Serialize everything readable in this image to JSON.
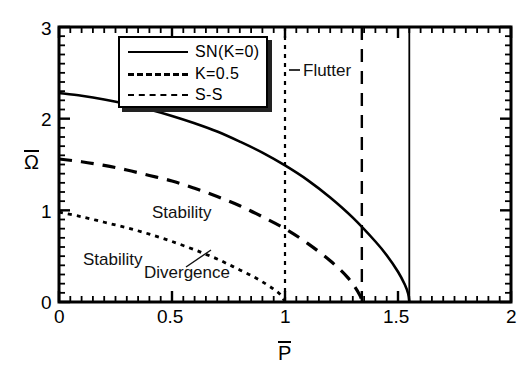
{
  "chart_data": {
    "type": "line",
    "title": "",
    "xlabel": "P̄",
    "ylabel": "Ω̄",
    "xlim": [
      0,
      2
    ],
    "ylim": [
      0,
      3
    ],
    "xticks": [
      "0",
      "0.5",
      "1",
      "1.5",
      "2"
    ],
    "xtick_values": [
      0,
      0.5,
      1,
      1.5,
      2
    ],
    "yticks": [
      "0",
      "1",
      "2",
      "3"
    ],
    "ytick_values": [
      0,
      1,
      2,
      3
    ],
    "grid": false,
    "legend_position": "top-left",
    "series": [
      {
        "name": "SN(K=0)",
        "style": "solid",
        "x": [
          0.0,
          0.1,
          0.2,
          0.3,
          0.4,
          0.5,
          0.6,
          0.7,
          0.8,
          0.9,
          1.0,
          1.1,
          1.2,
          1.3,
          1.4,
          1.45,
          1.5,
          1.53,
          1.545,
          1.55
        ],
        "y": [
          2.28,
          2.25,
          2.21,
          2.16,
          2.1,
          2.03,
          1.95,
          1.86,
          1.75,
          1.63,
          1.49,
          1.33,
          1.14,
          0.92,
          0.66,
          0.51,
          0.33,
          0.19,
          0.09,
          0.0
        ]
      },
      {
        "name": "K=0.5",
        "style": "dashed",
        "x": [
          0.0,
          0.1,
          0.2,
          0.3,
          0.4,
          0.5,
          0.6,
          0.7,
          0.8,
          0.9,
          1.0,
          1.1,
          1.2,
          1.28,
          1.33,
          1.34
        ],
        "y": [
          1.56,
          1.53,
          1.49,
          1.44,
          1.38,
          1.32,
          1.24,
          1.15,
          1.05,
          0.93,
          0.8,
          0.64,
          0.45,
          0.26,
          0.08,
          0.0
        ]
      },
      {
        "name": "S-S",
        "style": "dotted",
        "x": [
          0.0,
          0.1,
          0.2,
          0.3,
          0.4,
          0.5,
          0.6,
          0.65,
          0.7,
          0.75,
          0.8,
          0.85,
          0.9,
          0.95,
          0.98,
          1.0
        ],
        "y": [
          0.98,
          0.93,
          0.87,
          0.81,
          0.74,
          0.66,
          0.57,
          0.52,
          0.47,
          0.41,
          0.35,
          0.29,
          0.22,
          0.14,
          0.08,
          0.0
        ]
      }
    ],
    "vertical_lines": [
      {
        "name": "s-s-critical",
        "x": 1.0,
        "style": "dotted"
      },
      {
        "name": "k05-critical",
        "x": 1.34,
        "style": "dashed"
      },
      {
        "name": "sn-critical",
        "x": 1.55,
        "style": "solid"
      }
    ],
    "annotations": [
      {
        "name": "flutter",
        "text": "Flutter",
        "x": 1.1,
        "y": 2.58
      },
      {
        "name": "stability-upper",
        "text": "Stability",
        "x": 0.42,
        "y": 0.99
      },
      {
        "name": "stability-lower",
        "text": "Stability",
        "x": 0.09,
        "y": 0.52
      },
      {
        "name": "divergence",
        "text": "Divergence",
        "x": 0.38,
        "y": 0.36
      }
    ]
  },
  "axes": {
    "x_title": "P",
    "y_title": "Ω",
    "x_tick_labels": [
      "0",
      "0.5",
      "1",
      "1.5",
      "2"
    ],
    "y_tick_labels": [
      "0",
      "1",
      "2",
      "3"
    ]
  },
  "legend": {
    "entries": [
      {
        "label": "SN(K=0)",
        "style": "solid"
      },
      {
        "label": "K=0.5",
        "style": "dashed"
      },
      {
        "label": "S-S",
        "style": "dotted"
      }
    ]
  },
  "annotations": {
    "flutter": "Flutter",
    "stability_upper": "Stability",
    "stability_lower": "Stability",
    "divergence": "Divergence"
  },
  "colors": {
    "line": "#000000",
    "background": "#ffffff",
    "text": "#111111"
  }
}
